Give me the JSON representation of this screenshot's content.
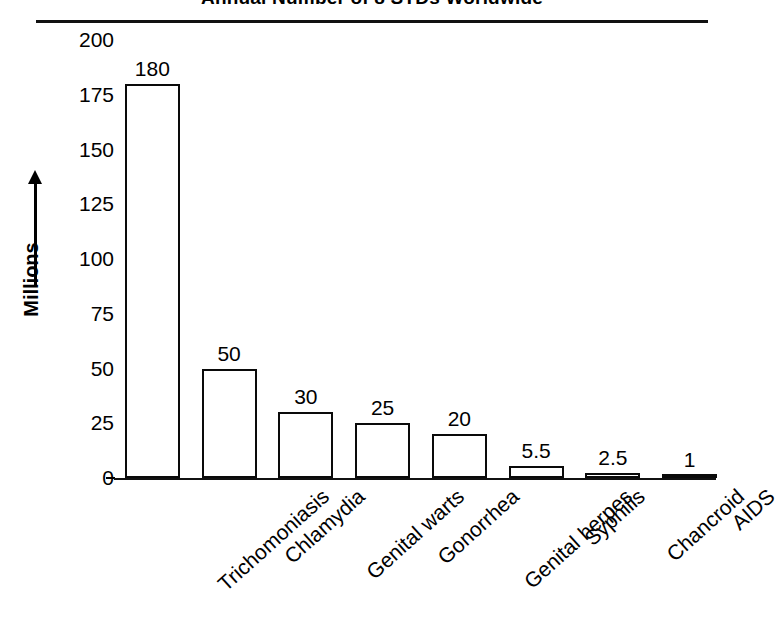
{
  "chart_data": {
    "type": "bar",
    "title": "Annual Number of 8 STDs Worldwide",
    "xlabel": "",
    "ylabel": "Millions",
    "ylim": [
      0,
      200
    ],
    "yticks": [
      200,
      175,
      150,
      125,
      100,
      75,
      50,
      25,
      0
    ],
    "grid": false,
    "legend": false,
    "categories": [
      "Trichomoniasis",
      "Chlamydia",
      "Genital warts",
      "Gonorrhea",
      "Genital herpes",
      "Syphilis",
      "Chancroid",
      "AIDS"
    ],
    "values": [
      180,
      50,
      30,
      25,
      20,
      5.5,
      2.5,
      1
    ],
    "value_labels": [
      "180",
      "50",
      "30",
      "25",
      "20",
      "5.5",
      "2.5",
      "1"
    ],
    "bar_fill_color": "#ffffff",
    "bar_edge_color": "#0a0a0a"
  },
  "axis": {
    "y_label_text": "Millions",
    "y_arrow_icon": "up-arrow-icon"
  }
}
